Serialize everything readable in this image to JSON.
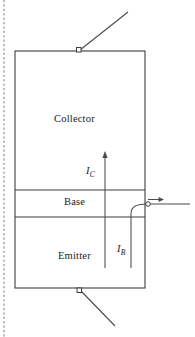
{
  "figure": {
    "width": 195,
    "height": 337,
    "background": "#ffffff",
    "line_color": "#3d3d3d",
    "text_color": "#1c1c1c",
    "margin_rule_color": "#6b6b6b"
  },
  "device": {
    "body": {
      "x": 15,
      "y": 51,
      "width": 130,
      "height": 237
    },
    "regions": [
      {
        "name": "collector",
        "label": "Collector",
        "y_top": 51,
        "y_bottom": 190,
        "label_x": 80,
        "label_y": 120
      },
      {
        "name": "base",
        "label": "Base",
        "y_top": 190,
        "y_bottom": 217,
        "label_x": 80,
        "label_y": 203
      },
      {
        "name": "emitter",
        "label": "Emitter",
        "y_top": 217,
        "y_bottom": 288,
        "label_x": 82,
        "label_y": 257
      }
    ]
  },
  "terminals": [
    {
      "name": "collector-terminal",
      "marker": "square",
      "x": 78,
      "y": 51,
      "lead_from": [
        78,
        51
      ],
      "lead_to": [
        128,
        12
      ]
    },
    {
      "name": "base-terminal",
      "marker": "circle",
      "x": 148,
      "y": 204,
      "lead_from": [
        148,
        204
      ],
      "lead_to": [
        190,
        204
      ]
    },
    {
      "name": "emitter-terminal",
      "marker": "square",
      "x": 79,
      "y": 288,
      "lead_from": [
        79,
        288
      ],
      "lead_to": [
        115,
        325
      ]
    }
  ],
  "currents": [
    {
      "name": "collector-current",
      "symbol": "I",
      "subscript": "C",
      "label_x": 86,
      "label_y": 165,
      "arrow_from": [
        105,
        268
      ],
      "arrow_to": [
        105,
        152
      ],
      "direction": "up"
    },
    {
      "name": "base-current",
      "symbol": "I",
      "subscript": "B",
      "label_x": 117,
      "label_y": 243,
      "path_from": [
        131,
        268
      ],
      "path_to": [
        148,
        204
      ],
      "direction": "up-then-right"
    },
    {
      "name": "base-current-arrow",
      "symbol": "",
      "subscript": "",
      "arrow_from": [
        148,
        200
      ],
      "arrow_to": [
        164,
        200
      ],
      "direction": "right"
    }
  ],
  "margin_rule": {
    "name": "page-margin-dashed-rule",
    "x": 4,
    "y_top": 0,
    "y_bottom": 337,
    "style": "dashed"
  }
}
